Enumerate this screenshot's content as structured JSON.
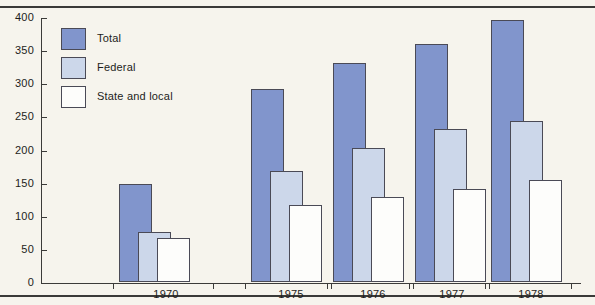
{
  "chart_data": {
    "type": "bar",
    "title": "",
    "subtitle": "",
    "xlabel": "",
    "ylabel": "",
    "categories": [
      "1970",
      "1975",
      "1976",
      "1977",
      "1978"
    ],
    "series": [
      {
        "name": "Total",
        "color": "#8195cc",
        "values": [
          148,
          292,
          331,
          360,
          396
        ]
      },
      {
        "name": "Federal",
        "color": "#ccd7ea",
        "values": [
          75,
          168,
          202,
          231,
          243
        ]
      },
      {
        "name": "State and local",
        "color": "#fdfdfb",
        "values": [
          67,
          117,
          128,
          140,
          154
        ]
      }
    ],
    "ylim": [
      0,
      400
    ],
    "ytick_values": [
      0,
      50,
      100,
      150,
      200,
      250,
      300,
      350,
      400
    ],
    "ytick_labels": [
      "0",
      "50",
      "100",
      "150",
      "200",
      "250",
      "300",
      "350",
      "400"
    ],
    "grid": false,
    "legend_position": "upper-left",
    "bar_style": "overlapping-offset",
    "annotations": []
  },
  "legend": {
    "items": [
      {
        "label": "Total",
        "swatch": "#8195cc"
      },
      {
        "label": "Federal",
        "swatch": "#ccd7ea"
      },
      {
        "label": "State and local",
        "swatch": "#fdfdfb"
      }
    ]
  },
  "colors": {
    "total": "#8195cc",
    "federal": "#ccd7ea",
    "state_and_local": "#fdfdfb",
    "axis": "#3b3b39",
    "bar_outline": "#4a4a56",
    "background": "#f6f4ed",
    "text": "#1d1d1b"
  }
}
